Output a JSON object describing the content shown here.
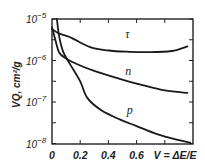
{
  "chart_data": {
    "type": "line",
    "title": "",
    "xlabel": "V = ΔE/E",
    "ylabel": "VQ, cm²/g",
    "xlim": [
      0,
      1.0
    ],
    "ylim_log10": [
      -8,
      -5
    ],
    "yscale": "log",
    "grid": false,
    "legend": "inline curve labels",
    "x_ticks": [
      0,
      0.2,
      0.4,
      0.6,
      0.8
    ],
    "x_tick_labels": [
      "0",
      "0.2",
      "0.4",
      "0.6",
      "V = ΔE/E"
    ],
    "y_ticks_log10": [
      -5,
      -6,
      -7,
      -8
    ],
    "y_tick_labels": [
      {
        "base": "10",
        "exp": "−5"
      },
      {
        "base": "10",
        "exp": "−6"
      },
      {
        "base": "10",
        "exp": "−7"
      },
      {
        "base": "10",
        "exp": "−8"
      }
    ],
    "series": [
      {
        "name": "τ",
        "label_pos": {
          "V": 0.52,
          "log10": -5.45
        },
        "points": [
          {
            "V": 0.0,
            "log10": -5.24
          },
          {
            "V": 0.05,
            "log10": -5.35
          },
          {
            "V": 0.13,
            "log10": -5.44
          },
          {
            "V": 0.27,
            "log10": -5.68
          },
          {
            "V": 0.4,
            "log10": -5.76
          },
          {
            "V": 0.55,
            "log10": -5.79
          },
          {
            "V": 0.7,
            "log10": -5.8
          },
          {
            "V": 0.85,
            "log10": -5.77
          },
          {
            "V": 0.96,
            "log10": -5.66
          }
        ]
      },
      {
        "name": "n",
        "label_pos": {
          "V": 0.52,
          "log10": -6.35
        },
        "points": [
          {
            "V": 0.0,
            "log10": -5.2
          },
          {
            "V": 0.02,
            "log10": -5.45
          },
          {
            "V": 0.05,
            "log10": -5.8
          },
          {
            "V": 0.1,
            "log10": -5.95
          },
          {
            "V": 0.2,
            "log10": -6.12
          },
          {
            "V": 0.3,
            "log10": -6.25
          },
          {
            "V": 0.48,
            "log10": -6.44
          },
          {
            "V": 0.65,
            "log10": -6.6
          },
          {
            "V": 0.8,
            "log10": -6.72
          },
          {
            "V": 0.96,
            "log10": -6.78
          }
        ]
      },
      {
        "name": "p",
        "label_pos": {
          "V": 0.53,
          "log10": -7.28
        },
        "points": [
          {
            "V": 0.035,
            "log10": -4.95
          },
          {
            "V": 0.05,
            "log10": -5.4
          },
          {
            "V": 0.08,
            "log10": -5.8
          },
          {
            "V": 0.13,
            "log10": -6.1
          },
          {
            "V": 0.2,
            "log10": -6.5
          },
          {
            "V": 0.25,
            "log10": -6.9
          },
          {
            "V": 0.35,
            "log10": -7.2
          },
          {
            "V": 0.48,
            "log10": -7.42
          },
          {
            "V": 0.6,
            "log10": -7.58
          },
          {
            "V": 0.75,
            "log10": -7.78
          },
          {
            "V": 0.9,
            "log10": -7.92
          },
          {
            "V": 0.98,
            "log10": -7.98
          }
        ]
      }
    ]
  },
  "layout": {
    "plot_left": 52,
    "plot_right": 193,
    "plot_top": 19,
    "plot_bottom": 144,
    "y_top_log10": -5,
    "px_per_decade": 41.5,
    "x_range": 1.0
  }
}
